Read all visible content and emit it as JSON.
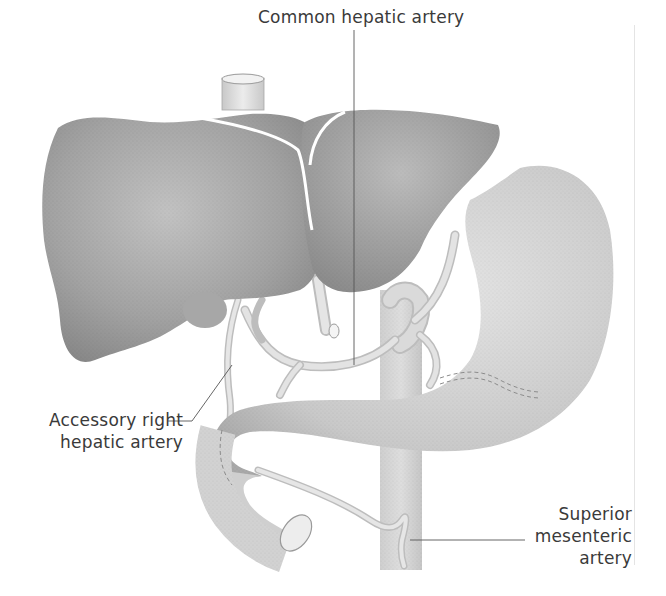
{
  "figure": {
    "structures": [
      "liver",
      "inferior vena cava",
      "gallbladder",
      "stomach",
      "duodenum",
      "aorta",
      "common hepatic artery",
      "accessory right hepatic artery",
      "superior mesenteric artery"
    ]
  },
  "labels": {
    "common_hepatic": {
      "text": "Common hepatic artery"
    },
    "accessory_right": {
      "line1": "Accessory right",
      "line2": "hepatic artery"
    },
    "sma": {
      "line1": "Superior",
      "line2": "mesenteric",
      "line3": "artery"
    }
  },
  "colors": {
    "background": "#ffffff",
    "liver": "#9a9a9a",
    "stomach": "#c8c8c8",
    "vessel": "#d8d8d8",
    "label_text": "#3a3a3a",
    "leader_line": "#555555"
  }
}
